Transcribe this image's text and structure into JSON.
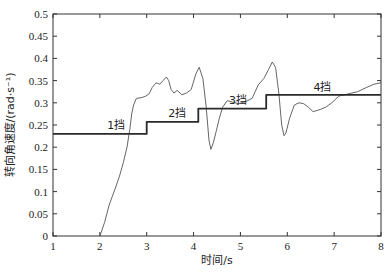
{
  "chart_data": {
    "type": "line",
    "title": "",
    "xlabel": "时间/s",
    "ylabel": "转向角速度/(rad·s⁻¹)",
    "xlim": [
      1,
      8
    ],
    "ylim": [
      0,
      0.5
    ],
    "xticks": [
      1,
      2,
      3,
      4,
      5,
      6,
      7,
      8
    ],
    "xtick_labels": [
      "1",
      "2",
      "3",
      "4",
      "5",
      "6",
      "7",
      "8"
    ],
    "yticks": [
      0,
      0.05,
      0.1,
      0.15,
      0.2,
      0.25,
      0.3,
      0.35,
      0.4,
      0.45,
      0.5
    ],
    "ytick_labels": [
      "0",
      "0.05",
      "0.1",
      "0.15",
      "0.2",
      "0.25",
      "0.3",
      "0.35",
      "0.4",
      "0.45",
      "0.5"
    ],
    "grid": false,
    "legend": "none",
    "series": [
      {
        "name": "measured steering angular velocity",
        "style": "thin",
        "x": [
          2.0,
          2.1,
          2.2,
          2.32,
          2.42,
          2.5,
          2.58,
          2.64,
          2.68,
          2.72,
          2.78,
          2.9,
          2.98,
          3.05,
          3.12,
          3.2,
          3.28,
          3.35,
          3.42,
          3.47,
          3.52,
          3.58,
          3.65,
          3.75,
          3.85,
          3.95,
          4.05,
          4.12,
          4.2,
          4.27,
          4.33,
          4.37,
          4.42,
          4.48,
          4.55,
          4.62,
          4.72,
          4.82,
          4.95,
          5.1,
          5.25,
          5.38,
          5.5,
          5.6,
          5.68,
          5.75,
          5.82,
          5.88,
          5.93,
          5.97,
          6.05,
          6.15,
          6.25,
          6.35,
          6.45,
          6.55,
          6.7,
          6.82,
          6.95,
          7.1,
          7.3,
          7.5,
          7.7,
          7.85,
          8.0
        ],
        "values": [
          0.0,
          0.03,
          0.07,
          0.105,
          0.135,
          0.165,
          0.2,
          0.24,
          0.275,
          0.295,
          0.31,
          0.312,
          0.315,
          0.32,
          0.335,
          0.345,
          0.342,
          0.35,
          0.358,
          0.35,
          0.33,
          0.322,
          0.328,
          0.318,
          0.322,
          0.33,
          0.365,
          0.38,
          0.355,
          0.29,
          0.215,
          0.195,
          0.21,
          0.235,
          0.265,
          0.29,
          0.305,
          0.302,
          0.298,
          0.302,
          0.31,
          0.34,
          0.355,
          0.375,
          0.392,
          0.38,
          0.32,
          0.25,
          0.226,
          0.232,
          0.265,
          0.295,
          0.3,
          0.298,
          0.29,
          0.28,
          0.285,
          0.29,
          0.3,
          0.315,
          0.32,
          0.325,
          0.335,
          0.342,
          0.345
        ]
      },
      {
        "name": "gear target",
        "style": "thick-step",
        "x": [
          1,
          3,
          3,
          4.1,
          4.1,
          5.55,
          5.55,
          8
        ],
        "values": [
          0.23,
          0.23,
          0.257,
          0.257,
          0.287,
          0.287,
          0.318,
          0.318
        ]
      }
    ],
    "annotations": [
      {
        "text": "1挡",
        "x": 2.35,
        "y": 0.24
      },
      {
        "text": "2挡",
        "x": 3.65,
        "y": 0.267
      },
      {
        "text": "3挡",
        "x": 4.95,
        "y": 0.297
      },
      {
        "text": "4挡",
        "x": 6.75,
        "y": 0.327
      }
    ]
  }
}
